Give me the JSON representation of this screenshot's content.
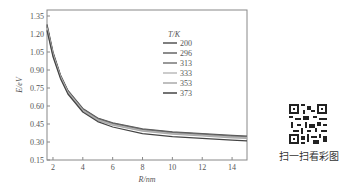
{
  "chart_data": {
    "type": "line",
    "title": "",
    "xlabel": "R/nm",
    "ylabel": "E/eV",
    "xlim": [
      1.6,
      15
    ],
    "ylim": [
      0.15,
      1.4
    ],
    "xticks": [
      2,
      4,
      6,
      8,
      10,
      12,
      14
    ],
    "yticks": [
      0.15,
      0.3,
      0.45,
      0.6,
      0.75,
      0.9,
      1.05,
      1.2,
      1.35
    ],
    "ytick_labels": [
      "0.15",
      "0.30",
      "0.45",
      "0.60",
      "0.75",
      "0.90",
      "1.05",
      "1.20",
      "1.35"
    ],
    "grid": false,
    "legend_title": "T/K",
    "legend_position": "upper right inside",
    "x": [
      1.6,
      2,
      2.5,
      3,
      4,
      5,
      6,
      8,
      10,
      12,
      14,
      15
    ],
    "series": [
      {
        "name": "200",
        "color": "#555555",
        "values": [
          1.28,
          1.05,
          0.86,
          0.73,
          0.58,
          0.5,
          0.46,
          0.41,
          0.385,
          0.37,
          0.355,
          0.35
        ]
      },
      {
        "name": "296",
        "color": "#666666",
        "values": [
          1.27,
          1.04,
          0.855,
          0.725,
          0.575,
          0.495,
          0.455,
          0.405,
          0.38,
          0.365,
          0.35,
          0.345
        ]
      },
      {
        "name": "313",
        "color": "#777777",
        "values": [
          1.26,
          1.035,
          0.85,
          0.72,
          0.57,
          0.49,
          0.45,
          0.4,
          0.375,
          0.36,
          0.345,
          0.34
        ]
      },
      {
        "name": "333",
        "color": "#bbbbbb",
        "values": [
          1.25,
          1.03,
          0.845,
          0.715,
          0.565,
          0.485,
          0.445,
          0.395,
          0.37,
          0.355,
          0.34,
          0.335
        ]
      },
      {
        "name": "353",
        "color": "#aaaaaa",
        "values": [
          1.24,
          1.02,
          0.84,
          0.71,
          0.56,
          0.48,
          0.44,
          0.39,
          0.365,
          0.35,
          0.335,
          0.33
        ]
      },
      {
        "name": "373",
        "color": "#444444",
        "values": [
          1.23,
          1.01,
          0.83,
          0.7,
          0.55,
          0.47,
          0.425,
          0.37,
          0.345,
          0.33,
          0.315,
          0.31
        ]
      }
    ]
  },
  "qr": {
    "caption": "扫一扫看彩图"
  }
}
